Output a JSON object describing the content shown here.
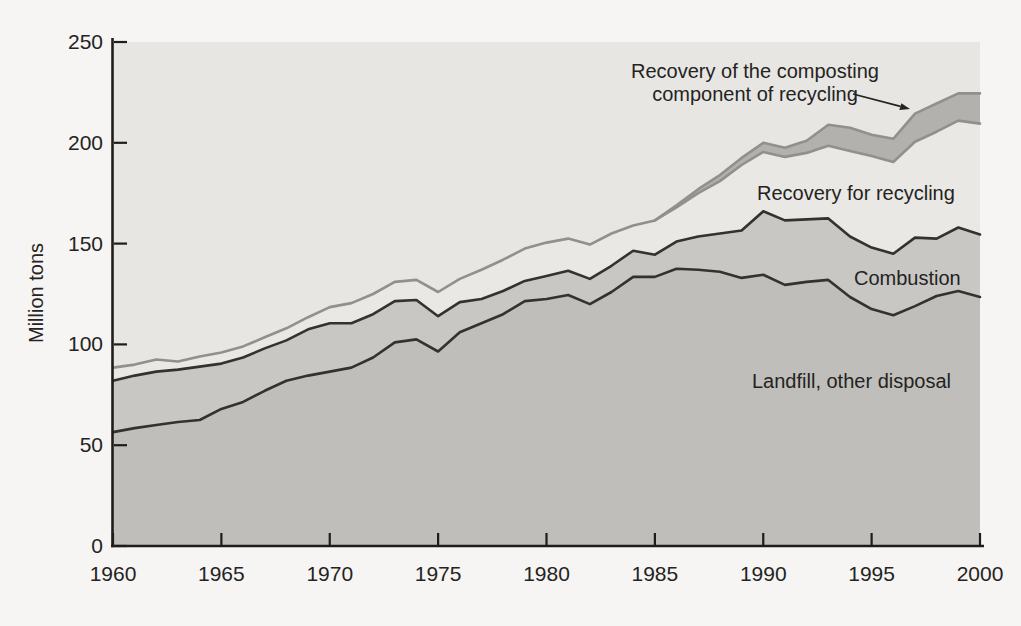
{
  "page": {
    "background": "#f6f5f3"
  },
  "labels": {
    "composting_annotation": "Recovery of the composting component of recycling",
    "recycling_area": "Recovery for recycling",
    "combustion_area": "Combustion",
    "landfill_area": "Landfill, other disposal"
  },
  "chart_data": {
    "type": "area",
    "stacked": true,
    "title": "",
    "xlabel": "",
    "ylabel": "Million tons",
    "xlim": [
      1960,
      2000
    ],
    "ylim": [
      0,
      250
    ],
    "x_ticks": [
      1960,
      1965,
      1970,
      1975,
      1980,
      1985,
      1990,
      1995,
      2000
    ],
    "y_ticks": [
      0,
      50,
      100,
      150,
      200,
      250
    ],
    "grid": false,
    "legend_position": "labels-inside-areas",
    "tick_direction": "in",
    "x": [
      1960,
      1961,
      1962,
      1963,
      1964,
      1965,
      1966,
      1967,
      1968,
      1969,
      1970,
      1971,
      1972,
      1973,
      1974,
      1975,
      1976,
      1977,
      1978,
      1979,
      1980,
      1981,
      1982,
      1983,
      1984,
      1985,
      1986,
      1987,
      1988,
      1989,
      1990,
      1991,
      1992,
      1993,
      1994,
      1995,
      1996,
      1997,
      1998,
      1999,
      2000
    ],
    "series": [
      {
        "name": "Landfill, other disposal",
        "values": [
          56.5,
          58.5,
          60,
          61.5,
          62.5,
          68,
          71.5,
          77,
          82,
          84.5,
          86.5,
          88.5,
          93.5,
          101,
          102.5,
          96.5,
          106,
          110.5,
          115,
          121.5,
          122.5,
          124.5,
          120,
          126,
          133.5,
          133.5,
          137.5,
          137,
          136,
          133,
          134.5,
          129.5,
          131,
          132,
          123.5,
          117.5,
          114.5,
          119,
          124,
          126.5,
          123.5
        ]
      },
      {
        "name": "Combustion",
        "values": [
          25.5,
          26,
          26.5,
          26,
          26.5,
          22.5,
          22,
          21,
          20,
          23,
          24,
          22,
          21.5,
          20.5,
          19.5,
          17.5,
          15,
          12,
          11.5,
          10,
          11.5,
          12,
          12.5,
          13,
          13,
          11,
          13.5,
          16.5,
          19,
          23.5,
          31.5,
          32,
          31,
          30.5,
          30,
          30.5,
          30.5,
          34,
          28.5,
          31.5,
          31
        ]
      },
      {
        "name": "Recovery for recycling",
        "values": [
          6.5,
          5.5,
          6,
          4,
          5,
          5.5,
          5.5,
          5.5,
          6,
          6,
          8,
          10,
          10,
          9.5,
          10,
          12,
          11.5,
          14.5,
          15.5,
          16,
          16.5,
          16,
          17,
          16,
          12.5,
          17,
          17,
          21.5,
          26,
          32.5,
          29.5,
          31.5,
          33,
          36,
          42.5,
          45.5,
          45.5,
          47.5,
          53,
          53,
          55
        ]
      },
      {
        "name": "Recovery of the composting component of recycling",
        "values": [
          0,
          0,
          0,
          0,
          0,
          0,
          0,
          0,
          0,
          0,
          0,
          0,
          0,
          0,
          0,
          0,
          0,
          0,
          0,
          0,
          0,
          0,
          0,
          0,
          0,
          0,
          1,
          2,
          3,
          3.5,
          4.5,
          4.5,
          6,
          10.5,
          11.5,
          10.5,
          11.5,
          14,
          14,
          13.5,
          15
        ]
      }
    ],
    "colors": {
      "plot_background": "#e7e6e3",
      "landfill_fill": "#bfbeba",
      "combustion_fill": "#c8c7c4",
      "recycling_fill": "#e9e8e5",
      "composting_fill": "#b2b1ad",
      "dark_boundary_line": "#333230",
      "gray_boundary_line": "#91908b",
      "axis": "#1e1d1b",
      "text": "#242321"
    }
  }
}
